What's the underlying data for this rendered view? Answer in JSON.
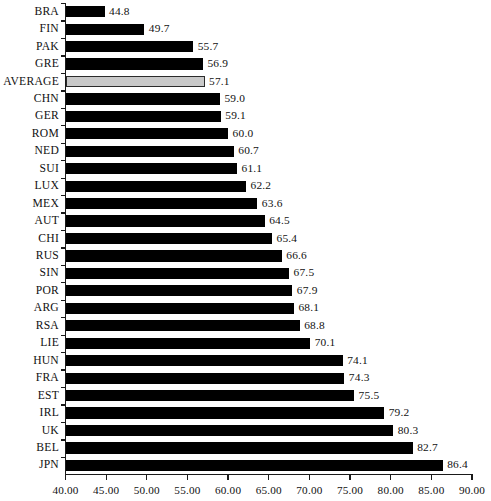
{
  "chart_data": {
    "type": "bar",
    "orientation": "horizontal",
    "title": "",
    "subtitle": "",
    "xlabel": "",
    "ylabel": "",
    "xlim": [
      40.0,
      90.0
    ],
    "xticks": [
      "40.00",
      "45.00",
      "50.00",
      "55.00",
      "60.00",
      "65.00",
      "70.00",
      "75.00",
      "80.00",
      "85.00",
      "90.00"
    ],
    "xtick_values": [
      40,
      45,
      50,
      55,
      60,
      65,
      70,
      75,
      80,
      85,
      90
    ],
    "grid": false,
    "legend": null,
    "categories": [
      "BRA",
      "FIN",
      "PAK",
      "GRE",
      "AVERAGE",
      "CHN",
      "GER",
      "ROM",
      "NED",
      "SUI",
      "LUX",
      "MEX",
      "AUT",
      "CHI",
      "RUS",
      "SIN",
      "POR",
      "ARG",
      "RSA",
      "LIE",
      "HUN",
      "FRA",
      "EST",
      "IRL",
      "UK",
      "BEL",
      "JPN"
    ],
    "values": [
      44.8,
      49.7,
      55.7,
      56.9,
      57.1,
      59.0,
      59.1,
      60.0,
      60.7,
      61.1,
      62.2,
      63.6,
      64.5,
      65.4,
      66.6,
      67.5,
      67.9,
      68.1,
      68.8,
      70.1,
      74.1,
      74.3,
      75.5,
      79.2,
      80.3,
      82.7,
      86.4
    ],
    "value_labels": [
      "44.8",
      "49.7",
      "55.7",
      "56.9",
      "57.1",
      "59.0",
      "59.1",
      "60.0",
      "60.7",
      "61.1",
      "62.2",
      "63.6",
      "64.5",
      "65.4",
      "66.6",
      "67.5",
      "67.9",
      "68.1",
      "68.8",
      "70.1",
      "74.1",
      "74.3",
      "75.5",
      "79.2",
      "80.3",
      "82.7",
      "86.4"
    ],
    "highlight_category": "AVERAGE",
    "colors": {
      "bar": "#000000",
      "highlight_bar": "#c9c9c9",
      "highlight_border": "#2b2b2b",
      "axis": "#1a1a1a",
      "text": "#111111",
      "background": "#ffffff"
    }
  }
}
